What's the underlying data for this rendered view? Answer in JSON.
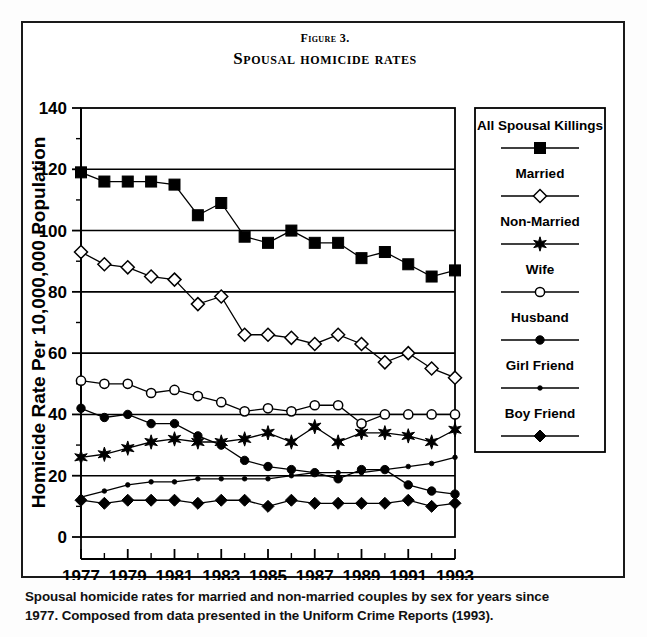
{
  "figure": {
    "number_label": "Figure 3.",
    "title": "Spousal homicide rates",
    "caption_line1": "Spousal homicide rates for married and non-married couples by sex for years since",
    "caption_line2": "1977. Composed from data presented in the Uniform Crime Reports (1993)."
  },
  "axes": {
    "y_title": "Homicide Rate Per 10,000,000 Population",
    "x_title": "Year",
    "y_ticks": [
      "0",
      "20",
      "40",
      "60",
      "80",
      "100",
      "120",
      "140"
    ],
    "x_ticks": [
      "1977",
      "1979",
      "1981",
      "1983",
      "1985",
      "1987",
      "1989",
      "1991",
      "1993"
    ]
  },
  "legend": {
    "entries": [
      {
        "label": "All Spousal Killings",
        "marker": "filled-square-marker",
        "color": "#000000"
      },
      {
        "label": "Married",
        "marker": "open-diamond-marker",
        "color": "#000000"
      },
      {
        "label": "Non-Married",
        "marker": "filled-star-marker",
        "color": "#000000"
      },
      {
        "label": "Wife",
        "marker": "open-circle-marker",
        "color": "#000000"
      },
      {
        "label": "Husband",
        "marker": "filled-circle-marker",
        "color": "#000000"
      },
      {
        "label": "Girl Friend",
        "marker": "small-dot-marker",
        "color": "#000000"
      },
      {
        "label": "Boy Friend",
        "marker": "filled-diamond-marker",
        "color": "#000000"
      }
    ]
  },
  "chart_data": {
    "type": "line",
    "title": "Spousal homicide rates",
    "xlabel": "Year",
    "ylabel": "Homicide Rate Per 10,000,000 Population",
    "xlim": [
      1977,
      1993
    ],
    "ylim": [
      0,
      140
    ],
    "grid": true,
    "legend_position": "right",
    "x": [
      1977,
      1978,
      1979,
      1980,
      1981,
      1982,
      1983,
      1984,
      1985,
      1986,
      1987,
      1988,
      1989,
      1990,
      1991,
      1992,
      1993
    ],
    "series": [
      {
        "name": "All Spousal Killings",
        "marker": "filled-square",
        "values": [
          119,
          116,
          116,
          116,
          115,
          105,
          109,
          98,
          96,
          100,
          96,
          96,
          91,
          93,
          89,
          85,
          87
        ]
      },
      {
        "name": "Married",
        "marker": "open-diamond",
        "values": [
          93,
          89,
          88,
          85,
          84,
          76,
          78.5,
          66,
          66,
          65,
          63,
          66,
          63,
          57,
          60,
          55,
          52
        ]
      },
      {
        "name": "Non-Married",
        "marker": "filled-star",
        "values": [
          26,
          27,
          29,
          31,
          32,
          31,
          31,
          32,
          34,
          31,
          36,
          31,
          34,
          34,
          33,
          31,
          35
        ]
      },
      {
        "name": "Wife",
        "marker": "open-circle",
        "values": [
          51,
          50,
          50,
          47,
          48,
          46,
          44,
          41,
          42,
          41,
          43,
          43,
          37,
          40,
          40,
          40,
          40
        ]
      },
      {
        "name": "Husband",
        "marker": "filled-circle",
        "values": [
          42,
          39,
          40,
          37,
          37,
          33,
          30,
          25,
          23,
          22,
          21,
          19,
          22,
          22,
          17,
          15,
          14
        ]
      },
      {
        "name": "Girl Friend",
        "marker": "small-dot",
        "values": [
          13,
          15,
          17,
          18,
          18,
          19,
          19,
          19,
          19,
          20,
          21,
          21,
          21,
          22,
          23,
          24,
          26
        ]
      },
      {
        "name": "Boy Friend",
        "marker": "filled-diamond",
        "values": [
          12,
          11,
          12,
          12,
          12,
          11,
          12,
          12,
          10,
          12,
          11,
          11,
          11,
          11,
          12,
          10,
          11
        ]
      }
    ]
  }
}
